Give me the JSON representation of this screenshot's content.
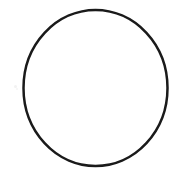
{
  "canvas": {
    "width": 183,
    "height": 175,
    "background_color": "#ffffff",
    "description": "Hand-drawn circle outline on a plain white background"
  },
  "figure": {
    "name": "circle",
    "type": "ellipse-outline",
    "filled": false,
    "fill_color": "none",
    "stroke_color": "#1a1a1a",
    "stroke_width": 2.5,
    "center_x": 95.5,
    "center_y": 88,
    "radius_x": 72,
    "radius_y": 78,
    "bounds": {
      "left": 23.5,
      "top": 10,
      "right": 167.5,
      "bottom": 166
    }
  },
  "artifacts": {
    "speckles": [
      {
        "x": 14,
        "y": 85,
        "size": 3,
        "color": "#f2f2f2"
      },
      {
        "x": 16,
        "y": 88,
        "size": 2,
        "color": "#f5f5f5"
      }
    ]
  },
  "text": {
    "labels": [],
    "note": "no text present in image"
  }
}
